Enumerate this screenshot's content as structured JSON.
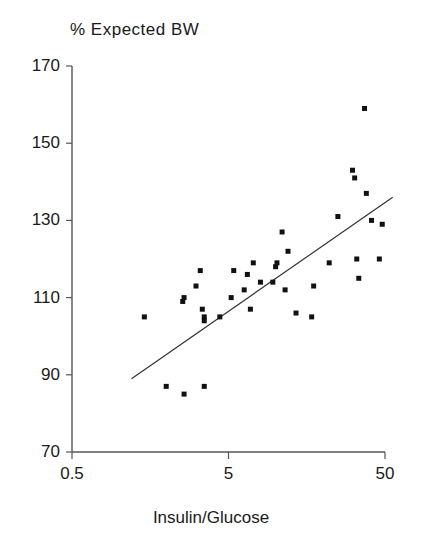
{
  "chart_data": {
    "type": "scatter",
    "title": "% Expected BW",
    "xlabel": "Insulin/Glucose",
    "ylabel": "% Expected BW",
    "xscale": "log",
    "yscale": "linear",
    "xlim": [
      0.5,
      50
    ],
    "ylim": [
      70,
      170
    ],
    "grid": false,
    "legend": null,
    "xticks": [
      0.5,
      5,
      50
    ],
    "xtick_labels": [
      "0.5",
      "5",
      "50"
    ],
    "yticks": [
      70,
      90,
      110,
      130,
      150,
      170
    ],
    "ytick_labels": [
      "70",
      "90",
      "110",
      "130",
      "150",
      "170"
    ],
    "marker": "square",
    "marker_color": "#111111",
    "marker_size": 5,
    "points": [
      {
        "x": 1.45,
        "y": 105
      },
      {
        "x": 2.0,
        "y": 87
      },
      {
        "x": 2.55,
        "y": 109
      },
      {
        "x": 2.6,
        "y": 110
      },
      {
        "x": 2.6,
        "y": 85
      },
      {
        "x": 3.1,
        "y": 113
      },
      {
        "x": 3.3,
        "y": 117
      },
      {
        "x": 3.4,
        "y": 107
      },
      {
        "x": 3.5,
        "y": 105
      },
      {
        "x": 3.5,
        "y": 104
      },
      {
        "x": 3.5,
        "y": 87
      },
      {
        "x": 4.4,
        "y": 105
      },
      {
        "x": 5.2,
        "y": 110
      },
      {
        "x": 5.4,
        "y": 117
      },
      {
        "x": 6.3,
        "y": 112
      },
      {
        "x": 6.6,
        "y": 116
      },
      {
        "x": 6.9,
        "y": 107
      },
      {
        "x": 7.2,
        "y": 119
      },
      {
        "x": 8.0,
        "y": 114
      },
      {
        "x": 9.6,
        "y": 114
      },
      {
        "x": 10.0,
        "y": 118
      },
      {
        "x": 10.2,
        "y": 119
      },
      {
        "x": 11.0,
        "y": 127
      },
      {
        "x": 11.5,
        "y": 112
      },
      {
        "x": 12.0,
        "y": 122
      },
      {
        "x": 13.5,
        "y": 106
      },
      {
        "x": 17.0,
        "y": 105
      },
      {
        "x": 17.5,
        "y": 113
      },
      {
        "x": 22.0,
        "y": 119
      },
      {
        "x": 25.0,
        "y": 131
      },
      {
        "x": 31.0,
        "y": 143
      },
      {
        "x": 32.0,
        "y": 141
      },
      {
        "x": 33.0,
        "y": 120
      },
      {
        "x": 34.0,
        "y": 115
      },
      {
        "x": 37.0,
        "y": 159
      },
      {
        "x": 38.0,
        "y": 137
      },
      {
        "x": 41.0,
        "y": 130
      },
      {
        "x": 46.0,
        "y": 120
      },
      {
        "x": 48.0,
        "y": 129
      }
    ],
    "fit_line": {
      "type": "linear-on-log-x",
      "x_start": 1.2,
      "y_start": 89,
      "x_end": 56,
      "y_end": 136,
      "color": "#333333"
    }
  },
  "axes": {
    "title_text": "% Expected BW",
    "x_axis_title": "Insulin/Glucose"
  }
}
